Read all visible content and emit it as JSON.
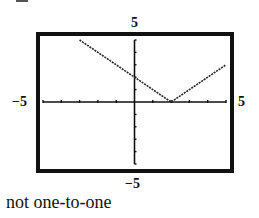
{
  "labels": {
    "y_max": "5",
    "y_min": "−5",
    "x_min": "−5",
    "x_max": "5"
  },
  "caption": "not one-to-one",
  "chart_data": {
    "type": "line",
    "title": "",
    "function": "y = |x - 2|",
    "xlabel": "",
    "ylabel": "",
    "xlim": [
      -5,
      5
    ],
    "ylim": [
      -5,
      5
    ],
    "tick_step": 1,
    "grid": false,
    "legend": null,
    "x": [
      -3,
      -2,
      -1,
      0,
      1,
      2,
      3,
      4,
      5
    ],
    "y": [
      5,
      4,
      3,
      2,
      1,
      0,
      1,
      2,
      3
    ],
    "series": [
      {
        "name": "graph",
        "x": [
          -3,
          2,
          5
        ],
        "y": [
          5,
          0,
          3
        ]
      }
    ],
    "annotations": [
      "not one-to-one"
    ]
  }
}
